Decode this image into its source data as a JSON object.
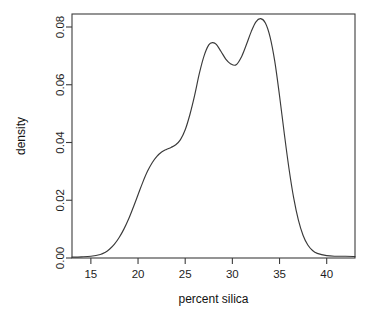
{
  "chart_data": {
    "type": "line",
    "title": "",
    "subtitle": "",
    "xlabel": "percent silica",
    "ylabel": "density",
    "xlim": [
      13.0,
      43.0
    ],
    "ylim": [
      0.0,
      0.0845
    ],
    "grid": false,
    "legend": null,
    "series": [
      {
        "name": "density",
        "x": [
          13.0,
          14.0,
          15.0,
          16.0,
          16.5,
          17.0,
          17.5,
          18.0,
          18.5,
          19.0,
          19.5,
          20.0,
          20.5,
          21.0,
          21.5,
          22.0,
          22.5,
          23.0,
          23.5,
          24.0,
          24.5,
          25.0,
          25.5,
          26.0,
          26.5,
          27.0,
          27.5,
          27.9,
          28.3,
          28.8,
          29.3,
          29.8,
          30.4,
          31.0,
          31.5,
          32.0,
          32.5,
          33.0,
          33.5,
          34.0,
          34.5,
          35.0,
          35.5,
          36.0,
          36.5,
          37.0,
          37.5,
          38.0,
          38.5,
          39.0,
          40.0,
          41.0,
          42.0,
          43.0
        ],
        "y": [
          0.0003,
          0.0004,
          0.0006,
          0.0012,
          0.0019,
          0.0031,
          0.0048,
          0.0071,
          0.01,
          0.0135,
          0.0176,
          0.0219,
          0.0262,
          0.03,
          0.033,
          0.0352,
          0.0367,
          0.0376,
          0.0383,
          0.0392,
          0.041,
          0.0444,
          0.0497,
          0.0563,
          0.0639,
          0.07,
          0.0738,
          0.0746,
          0.074,
          0.0715,
          0.0689,
          0.0673,
          0.0669,
          0.0699,
          0.074,
          0.0784,
          0.0818,
          0.0829,
          0.0814,
          0.0765,
          0.068,
          0.0562,
          0.0432,
          0.031,
          0.0208,
          0.0131,
          0.0078,
          0.0045,
          0.0026,
          0.0016,
          0.0008,
          0.0006,
          0.0006,
          0.0005
        ]
      }
    ],
    "x_ticks": [
      15,
      20,
      25,
      30,
      35,
      40
    ],
    "x_tick_labels": [
      "15",
      "20",
      "25",
      "30",
      "35",
      "40"
    ],
    "y_ticks": [
      0.0,
      0.02,
      0.04,
      0.06,
      0.08
    ],
    "y_tick_labels": [
      "0.00",
      "0.02",
      "0.04",
      "0.06",
      "0.08"
    ],
    "annotations": [
      {
        "label": "left-shoulder",
        "x": 24.0,
        "y": 0.0392
      },
      {
        "label": "first-peak",
        "x": 27.9,
        "y": 0.0746
      },
      {
        "label": "valley",
        "x": 30.4,
        "y": 0.0669
      },
      {
        "label": "second-peak",
        "x": 33.0,
        "y": 0.0829
      }
    ],
    "colors": {
      "curve": "#3a3a3a",
      "axis": "#3c3c3c",
      "background": "#ffffff",
      "text": "#1d1d1d"
    }
  },
  "axes": {
    "x_label": "percent silica",
    "y_label": "density"
  },
  "ticks": {
    "x": [
      "15",
      "20",
      "25",
      "30",
      "35",
      "40"
    ],
    "y": [
      "0.00",
      "0.02",
      "0.04",
      "0.06",
      "0.08"
    ]
  }
}
